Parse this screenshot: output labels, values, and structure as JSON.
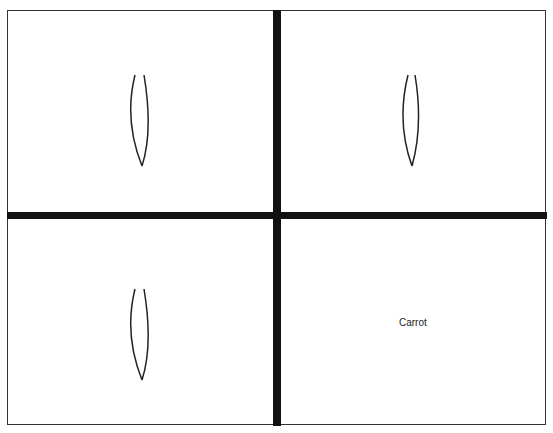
{
  "panels": [
    {
      "position": "top-left",
      "content": "shape",
      "shape": "leaf-outline-icon"
    },
    {
      "position": "top-right",
      "content": "shape",
      "shape": "leaf-outline-icon"
    },
    {
      "position": "bottom-left",
      "content": "shape",
      "shape": "leaf-outline-icon"
    },
    {
      "position": "bottom-right",
      "content": "text",
      "label": "Carrot"
    }
  ],
  "colors": {
    "stroke": "#222222",
    "divider": "#111111",
    "background": "#ffffff"
  }
}
